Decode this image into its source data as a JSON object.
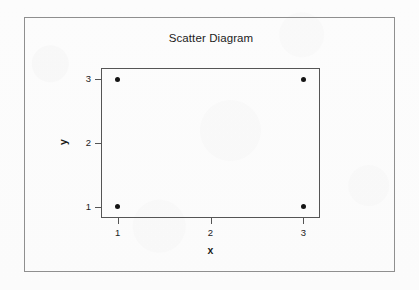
{
  "figure": {
    "frame_color": "#8f8f8f",
    "background_color": "#fdfdfd"
  },
  "chart_data": {
    "type": "scatter",
    "title": "Scatter Diagram",
    "xlabel": "x",
    "ylabel": "y",
    "xlim": [
      0.82,
      3.18
    ],
    "ylim": [
      0.82,
      3.18
    ],
    "grid": false,
    "legend": null,
    "marker": "filled-circle",
    "marker_color": "#141414",
    "x": [
      1,
      1,
      3,
      3
    ],
    "y": [
      1,
      3,
      1,
      3
    ],
    "points": [
      {
        "x": 1,
        "y": 1
      },
      {
        "x": 1,
        "y": 3
      },
      {
        "x": 3,
        "y": 1
      },
      {
        "x": 3,
        "y": 3
      }
    ],
    "xticks": [
      {
        "value": 1,
        "label": "1"
      },
      {
        "value": 2,
        "label": "2"
      },
      {
        "value": 3,
        "label": "3"
      }
    ],
    "yticks": [
      {
        "value": 1,
        "label": "1"
      },
      {
        "value": 2,
        "label": "2"
      },
      {
        "value": 3,
        "label": "3"
      }
    ]
  }
}
